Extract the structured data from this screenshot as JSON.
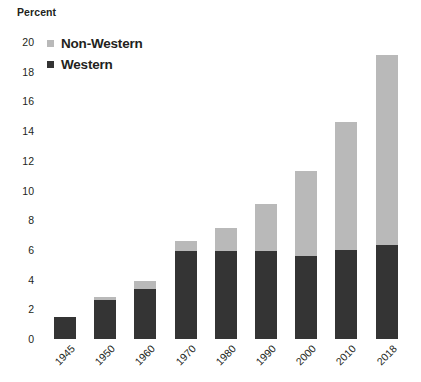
{
  "axis_title": "Percent",
  "colors": {
    "western": "#343434",
    "non_western": "#b9b9b9",
    "text": "#231f20",
    "background": "#ffffff"
  },
  "legend": {
    "position": "top-left-inside",
    "items": [
      {
        "label": "Non-Western",
        "swatch": "#b9b9b9",
        "icon": "square-swatch-icon"
      },
      {
        "label": "Western",
        "swatch": "#343434",
        "icon": "square-swatch-icon"
      }
    ]
  },
  "chart_data": {
    "type": "bar",
    "stacked": true,
    "title": "",
    "subtitle": "",
    "xlabel": "",
    "ylabel": "Percent",
    "ylim": [
      0,
      20
    ],
    "ytick_interval": 2,
    "grid": false,
    "legend_position": "top-left",
    "categories": [
      "1945",
      "1950",
      "1960",
      "1970",
      "1980",
      "1990",
      "2000",
      "2010",
      "2018"
    ],
    "ytick_labels": [
      "0",
      "2",
      "4",
      "6",
      "8",
      "10",
      "12",
      "14",
      "16",
      "18",
      "20"
    ],
    "series": [
      {
        "name": "Western",
        "color": "#343434",
        "values": [
          1.5,
          2.6,
          3.4,
          5.9,
          5.9,
          5.9,
          5.6,
          6.0,
          6.3
        ]
      },
      {
        "name": "Non-Western",
        "color": "#b9b9b9",
        "values": [
          0.0,
          0.2,
          0.5,
          0.7,
          1.6,
          3.2,
          5.7,
          8.6,
          12.8
        ]
      }
    ],
    "totals": [
      1.5,
      2.8,
      3.9,
      6.6,
      7.5,
      9.1,
      11.3,
      14.6,
      19.1
    ]
  }
}
